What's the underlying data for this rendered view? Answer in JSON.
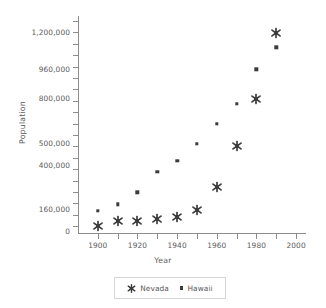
{
  "chart_data": {
    "type": "scatter",
    "title": "",
    "xlabel": "Year",
    "ylabel": "Population",
    "xlim": [
      1890,
      2005
    ],
    "ylim": [
      0,
      1260000
    ],
    "grid": false,
    "legend_position": "bottom",
    "x_ticks": [
      1900,
      1910,
      1920,
      1930,
      1940,
      1950,
      1960,
      1970,
      1980,
      1990,
      2000
    ],
    "x_tick_labels": [
      "1900",
      "",
      "1920",
      "",
      "1940",
      "",
      "1960",
      "",
      "1980",
      "",
      "2000"
    ],
    "y_tick_labels": [
      "0",
      "160,000",
      "400,000",
      "500,000",
      "800,000",
      "960,000",
      "1,200,000"
    ],
    "y_tick_values": [
      0,
      160000,
      400000,
      500000,
      800000,
      960000,
      1200000
    ],
    "categories": [
      1900,
      1910,
      1920,
      1930,
      1940,
      1950,
      1960,
      1970,
      1980,
      1990
    ],
    "series": [
      {
        "name": "Nevada",
        "marker": "asterisk",
        "color": "#3b3b3b",
        "values": [
          42335,
          81875,
          77407,
          91058,
          110247,
          160083,
          285278,
          488738,
          800493,
          1201833
        ]
      },
      {
        "name": "Hawaii",
        "marker": "square",
        "color": "#3b3b3b",
        "values": [
          154001,
          191874,
          255881,
          368336,
          422770,
          499794,
          632772,
          769913,
          964691,
          1108229
        ]
      }
    ]
  },
  "legend": {
    "entries": [
      {
        "label": "Nevada",
        "icon": "asterisk-marker-icon"
      },
      {
        "label": "Hawaii",
        "icon": "square-marker-icon"
      }
    ]
  },
  "axes": {
    "x_title": "Year",
    "y_title": "Population"
  }
}
